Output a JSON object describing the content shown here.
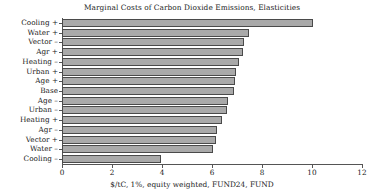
{
  "chart_data": {
    "type": "bar",
    "orientation": "horizontal",
    "title": "Marginal Costs of Carbon Dioxide Emissions, Elasticities",
    "xlabel": "$/tC, 1%, equity weighted, FUND24, FUND",
    "ylabel": "",
    "xlim": [
      0,
      12
    ],
    "xticks": [
      0,
      2,
      4,
      6,
      8,
      10,
      12
    ],
    "xticklabels": [
      "0",
      "2",
      "4",
      "6",
      "8",
      "10",
      "12"
    ],
    "grid": false,
    "legend": false,
    "bar_color": "#a9a9a9",
    "bar_edge_color": "#4a4a4a",
    "categories": [
      "Cooling +",
      "Water +",
      "Vector –",
      "Agr +",
      "Heating –",
      "Urban +",
      "Age +",
      "Base",
      "Age –",
      "Urban –",
      "Heating +",
      "Agr –",
      "Vector +",
      "Water –",
      "Cooling –"
    ],
    "values": [
      10.04,
      7.48,
      7.28,
      7.24,
      7.08,
      6.96,
      6.92,
      6.88,
      6.64,
      6.6,
      6.4,
      6.2,
      6.16,
      6.04,
      3.96
    ]
  }
}
